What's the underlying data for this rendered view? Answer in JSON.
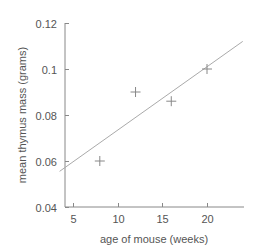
{
  "chart_data": {
    "type": "scatter",
    "title": "",
    "xlabel": "age of mouse (weeks)",
    "ylabel": "mean thymus mass (grams)",
    "xlim": [
      3.5,
      24
    ],
    "ylim": [
      0.04,
      0.12
    ],
    "x_ticks": [
      5,
      10,
      15,
      20
    ],
    "y_ticks": [
      0.04,
      0.06,
      0.08,
      0.1,
      0.12
    ],
    "x_tick_labels": [
      "5",
      "10",
      "15",
      "20"
    ],
    "y_tick_labels": [
      "0.04",
      "0.06",
      "0.08",
      "0.1",
      "0.12"
    ],
    "grid": false,
    "legend": null,
    "series": [
      {
        "name": "observed",
        "marker": "+",
        "x": [
          8,
          12,
          16,
          20
        ],
        "y": [
          0.06,
          0.09,
          0.086,
          0.1
        ]
      }
    ],
    "trendline": {
      "type": "linear",
      "start": {
        "x": 3.5,
        "y": 0.0555
      },
      "end": {
        "x": 24,
        "y": 0.112
      }
    },
    "colors": {
      "axis": "#888888",
      "marker": "#888888",
      "line": "#aaaaaa",
      "text": "#555555"
    }
  }
}
